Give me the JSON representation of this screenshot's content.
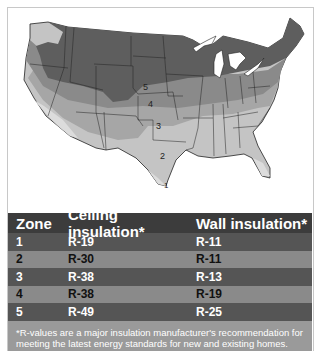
{
  "map": {
    "zone_labels": [
      "5",
      "4",
      "3",
      "2",
      "1"
    ],
    "colors": {
      "zone1": "#dcdcdc",
      "zone2": "#c4c4c4",
      "zone3": "#a6a6a6",
      "zone4": "#8a8a8a",
      "zone5": "#5e5e5e",
      "water": "#ffffff"
    }
  },
  "table": {
    "headers": [
      "Zone",
      "Ceiling insulation*",
      "Wall insulation*"
    ],
    "rows": [
      {
        "zone": "1",
        "ceiling": "R-19",
        "wall": "R-11"
      },
      {
        "zone": "2",
        "ceiling": "R-30",
        "wall": "R-11"
      },
      {
        "zone": "3",
        "ceiling": "R-38",
        "wall": "R-13"
      },
      {
        "zone": "4",
        "ceiling": "R-38",
        "wall": "R-19"
      },
      {
        "zone": "5",
        "ceiling": "R-49",
        "wall": "R-25"
      }
    ],
    "footnote": "*R-values are a major insulation manufacturer's recommendation for meeting the latest energy standards for new and existing homes."
  }
}
